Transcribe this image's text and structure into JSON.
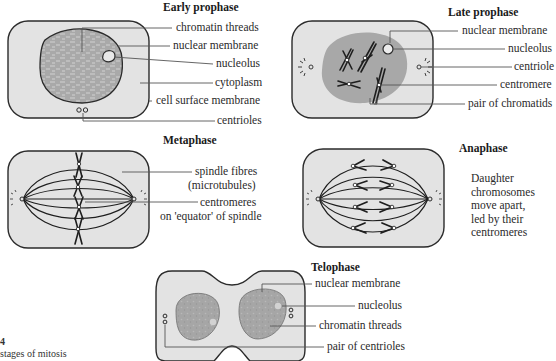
{
  "figure": {
    "caption_number": "4",
    "caption_text": "stages of mitosis"
  },
  "colors": {
    "cell_fill": "#e3e3e3",
    "nucleus_fill": "#a8a8a8",
    "outline": "#2b2b2b",
    "label_line": "#555555"
  },
  "stages": {
    "early_prophase": {
      "title": "Early prophase",
      "labels": [
        "chromatin threads",
        "nuclear membrane",
        "nucleolus",
        "cytoplasm",
        "cell surface membrane",
        "centrioles"
      ]
    },
    "late_prophase": {
      "title": "Late prophase",
      "labels": [
        "nuclear membrane",
        "nucleolus",
        "centriole",
        "centromere",
        "pair of chromatids"
      ]
    },
    "metaphase": {
      "title": "Metaphase",
      "labels": [
        "spindle fibres",
        "(microtubules)",
        "centromeres",
        "on 'equator' of spindle"
      ]
    },
    "anaphase": {
      "title": "Anaphase",
      "description": "Daughter\nchromosomes\nmove apart,\nled by their\ncentromeres"
    },
    "telophase": {
      "title": "Telophase",
      "labels": [
        "nuclear membrane",
        "nucleolus",
        "chromatin threads",
        "pair of centrioles"
      ]
    }
  }
}
